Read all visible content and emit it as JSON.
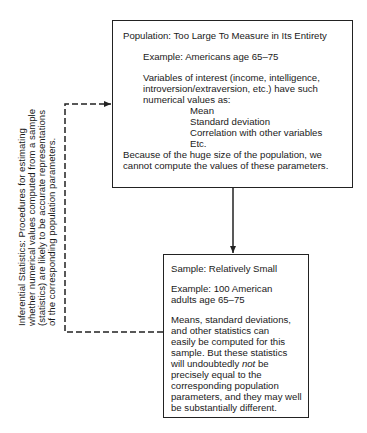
{
  "population_box": {
    "title": "Population: Too Large To Measure in Its Entirety",
    "example": "Example: Americans age 65–75",
    "variables_line1": "Variables of interest (income, intelligence,",
    "variables_line2": "introversion/extraversion, etc.) have such",
    "variables_line3": "numerical values as:",
    "parameters": [
      "Mean",
      "Standard deviation",
      "Correlation with other variables",
      "Etc."
    ],
    "conclusion_line1": "Because of the huge size of the population, we",
    "conclusion_line2": "cannot compute the values of these parameters."
  },
  "sample_box": {
    "title": "Sample: Relatively Small",
    "example_line1": "Example: 100 American",
    "example_line2": "adults age 65–75",
    "body_lines": [
      "Means, standard deviations,",
      "and other statistics can",
      "easily be computed for this",
      "sample. But these statistics"
    ],
    "line_pre_not": "will undoubtedly ",
    "not_word": "not",
    "line_post_not": " be",
    "tail_lines": [
      "precisely equal to the",
      "corresponding population",
      "parameters, and they may well",
      "be substantially different."
    ]
  },
  "side_label": {
    "lines": [
      "Inferential Statistics: Procedures for estimating",
      "whether numerical values computed from a sample",
      "(statistics) are likely to be accurate representations",
      "of the corresponding population parameters."
    ]
  },
  "colors": {
    "line": "#222222",
    "text": "#1a1a1a",
    "background": "#ffffff"
  }
}
